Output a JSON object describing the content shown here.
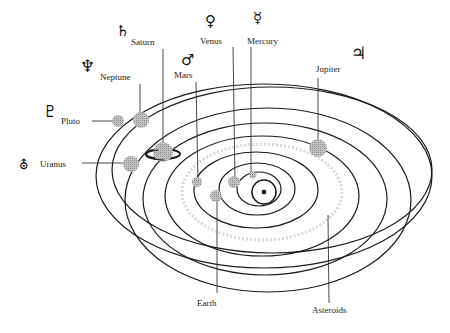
{
  "diagram": {
    "title": "",
    "sun": {
      "cx": 264,
      "cy": 192
    },
    "planets": [
      {
        "name": "Mercury",
        "symbol": "☿",
        "label_x": 248,
        "label_y": 39,
        "symbol_x": 256,
        "symbol_y": 18
      },
      {
        "name": "Venus",
        "symbol": "♀",
        "label_x": 200,
        "label_y": 39,
        "symbol_x": 207,
        "symbol_y": 19
      },
      {
        "name": "Earth",
        "symbol": "",
        "label_x": 197,
        "label_y": 300
      },
      {
        "name": "Mars",
        "symbol": "♂",
        "label_x": 174,
        "label_y": 72,
        "symbol_x": 182,
        "symbol_y": 53
      },
      {
        "name": "Jupiter",
        "symbol": "♃",
        "label_x": 316,
        "label_y": 66,
        "symbol_x": 353,
        "symbol_y": 49
      },
      {
        "name": "Saturn",
        "symbol": "♄",
        "label_x": 131,
        "label_y": 39,
        "symbol_x": 117,
        "symbol_y": 26
      },
      {
        "name": "Uranus",
        "symbol": "⛢",
        "label_x": 40,
        "label_y": 160,
        "symbol_x": 20,
        "symbol_y": 160
      },
      {
        "name": "Neptune",
        "symbol": "♆",
        "label_x": 100,
        "label_y": 74,
        "symbol_x": 80,
        "symbol_y": 58
      },
      {
        "name": "Pluto",
        "symbol": "♇",
        "label_x": 61,
        "label_y": 117,
        "symbol_x": 43,
        "symbol_y": 106
      },
      {
        "name": "Asteroids",
        "symbol": "",
        "label_x": 312,
        "label_y": 306
      }
    ],
    "colors": {
      "orbit": "#1a1a1a",
      "planet_fill": "#aaaaaa",
      "line": "#333333",
      "text": "#222222"
    }
  }
}
